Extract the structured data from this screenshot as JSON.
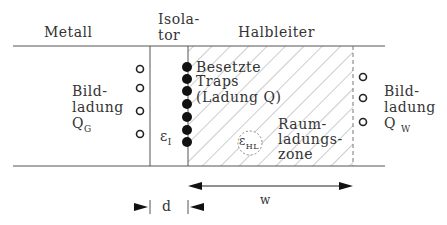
{
  "headers": {
    "metal": "Metall",
    "insulator_line1": "Isola-",
    "insulator_line2": "tor",
    "semiconductor": "Halbleiter"
  },
  "left_image_charge": {
    "line1": "Bild-",
    "line2": "ladung",
    "symbol": "Q",
    "subscript": "G"
  },
  "right_image_charge": {
    "line1": "Bild-",
    "line2": "ladung",
    "symbol": "Q",
    "subscript": "W"
  },
  "traps": {
    "line1": "Besetzte",
    "line2": "Traps",
    "line3": "(Ladung Q)"
  },
  "space_charge_zone": {
    "line1": "Raum-",
    "line2": "ladungs-",
    "line3": "zone"
  },
  "insulator_permittivity": {
    "symbol": "ε",
    "subscript": "I"
  },
  "semiconductor_permittivity": {
    "symbol": "ε",
    "subscript": "HL"
  },
  "dimensions": {
    "d": "d",
    "w": "w"
  },
  "colors": {
    "line": "#555555",
    "hatch": "#888888",
    "dot": "#111111"
  }
}
